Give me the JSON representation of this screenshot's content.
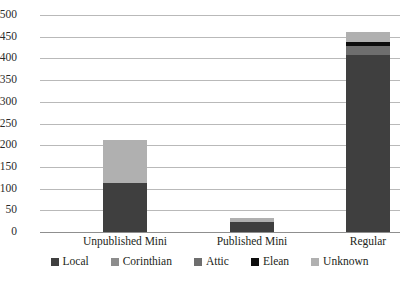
{
  "chart_data": {
    "type": "bar",
    "subtype": "stacked-bar",
    "title": "",
    "xlabel": "",
    "ylabel": "",
    "ylim": [
      0,
      500
    ],
    "ytick_step": 50,
    "yticks": [
      0,
      50,
      100,
      150,
      200,
      250,
      300,
      350,
      400,
      450,
      500
    ],
    "grid": true,
    "legend_position": "bottom",
    "categories": [
      "Unpublished Mini",
      "Published Mini",
      "Regular"
    ],
    "series": [
      {
        "name": "Local",
        "color": "#3f3f3f",
        "values": [
          113,
          24,
          408
        ]
      },
      {
        "name": "Corinthian",
        "color": "#8c8c8c",
        "values": [
          0,
          0,
          0
        ]
      },
      {
        "name": "Attic",
        "color": "#6e6e6e",
        "values": [
          0,
          0,
          20
        ]
      },
      {
        "name": "Elean",
        "color": "#0d0d0d",
        "values": [
          0,
          0,
          10
        ]
      },
      {
        "name": "Unknown",
        "color": "#b0b0b0",
        "values": [
          98,
          9,
          24
        ]
      }
    ],
    "totals": [
      211,
      33,
      462
    ]
  },
  "axis": {
    "y_labels": [
      "500",
      "450",
      "400",
      "350",
      "300",
      "250",
      "200",
      "150",
      "100",
      "50",
      "0"
    ],
    "x_labels": [
      "Unpublished Mini",
      "Published Mini",
      "Regular"
    ]
  },
  "legend": {
    "items": [
      {
        "label": "Local",
        "color": "#3f3f3f"
      },
      {
        "label": "Corinthian",
        "color": "#8c8c8c"
      },
      {
        "label": "Attic",
        "color": "#6e6e6e"
      },
      {
        "label": "Elean",
        "color": "#0d0d0d"
      },
      {
        "label": "Unknown",
        "color": "#b0b0b0"
      }
    ]
  },
  "style": {
    "gridline_color": "#b9b9b9",
    "axis_color": "#8f8f8f",
    "background": "#ffffff",
    "text_color": "#231f20"
  }
}
